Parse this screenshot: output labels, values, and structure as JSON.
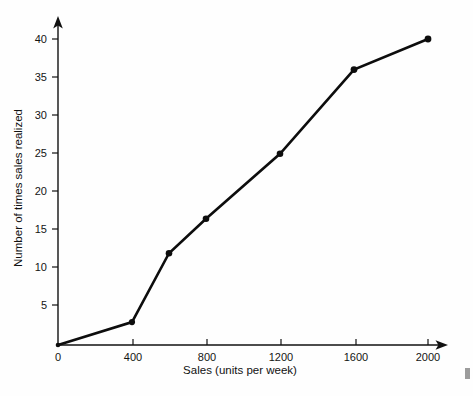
{
  "figure": {
    "background_color": "#fefefe",
    "ink_color": "#0d0d0d",
    "x_axis_title": "Sales (units per week)",
    "y_axis_title": "Number of times sales realized",
    "x_tick_labels": [
      "0",
      "400",
      "800",
      "1200",
      "1600",
      "2000"
    ],
    "y_tick_labels": [
      "5",
      "10",
      "15",
      "20",
      "25",
      "30",
      "35",
      "40"
    ],
    "origin_label": "0"
  },
  "chart_data": {
    "type": "line",
    "title": "",
    "subtitle": "",
    "xlabel": "Sales (units per week)",
    "ylabel": "Number of times sales realized",
    "xlim": [
      0,
      2160
    ],
    "ylim": [
      0,
      42
    ],
    "grid": false,
    "legend": null,
    "markers": "filled-circle",
    "xticks": [
      0,
      400,
      800,
      1200,
      1600,
      2000
    ],
    "yticks": [
      5,
      10,
      15,
      20,
      25,
      30,
      35,
      40
    ],
    "x": [
      0,
      400,
      600,
      800,
      1200,
      1600,
      2000
    ],
    "y": [
      0,
      3,
      12,
      16.5,
      25,
      36,
      40
    ],
    "points": [
      {
        "x": 0,
        "y": 0
      },
      {
        "x": 400,
        "y": 3
      },
      {
        "x": 600,
        "y": 12
      },
      {
        "x": 800,
        "y": 16.5
      },
      {
        "x": 1200,
        "y": 25
      },
      {
        "x": 1600,
        "y": 36
      },
      {
        "x": 2000,
        "y": 40
      }
    ],
    "series": [
      {
        "name": "Cumulative frequency of sales realized",
        "values": [
          0,
          3,
          12,
          16.5,
          25,
          36,
          40
        ]
      }
    ],
    "annotations": []
  }
}
